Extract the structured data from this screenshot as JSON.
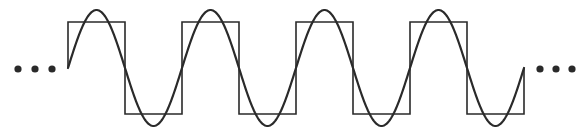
{
  "diagram": {
    "colors": {
      "stroke": "#2a2a2a",
      "background": "#ffffff"
    },
    "continuation_left": "...",
    "continuation_right": "...",
    "square_wave": {
      "start_x": 68,
      "end_x": 524,
      "period": 114,
      "top_y": 22,
      "bottom_y": 114,
      "mid_y": 68,
      "cycles": 4
    },
    "sine_wave": {
      "start_x": 68,
      "end_x": 524,
      "period": 114,
      "center_y": 68,
      "amplitude": 58
    },
    "dots": {
      "left_x": [
        18,
        35,
        52
      ],
      "right_x": [
        540,
        556,
        572
      ],
      "y": 69,
      "r": 3.6
    }
  }
}
